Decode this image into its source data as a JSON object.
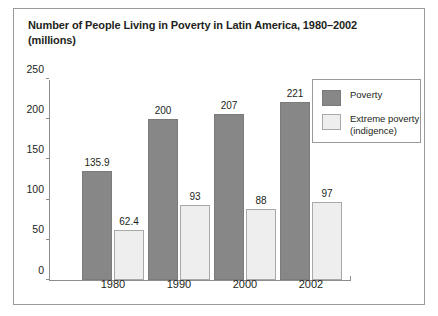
{
  "chart_data": {
    "type": "bar",
    "title": "Number of People Living in Poverty in Latin America, 1980–2002 (millions)",
    "xlabel": "",
    "ylabel": "",
    "ylim": [
      0,
      250
    ],
    "yticks": [
      "0",
      "50",
      "100",
      "150",
      "200",
      "250"
    ],
    "grid": false,
    "legend_position": "top-right",
    "categories": [
      "1980",
      "1990",
      "2000",
      "2002"
    ],
    "series": [
      {
        "name": "Poverty",
        "color": "#878787",
        "values": [
          135.9,
          200,
          207,
          221
        ],
        "labels": [
          "135.9",
          "200",
          "207",
          "221"
        ]
      },
      {
        "name": "Extreme poverty (indigence)",
        "color": "#eeeeee",
        "values": [
          62.4,
          93,
          88,
          97
        ],
        "labels": [
          "62.4",
          "93",
          "88",
          "97"
        ]
      }
    ]
  },
  "figure": {
    "title_line1": "Number of People Living in Poverty in Latin America, 1980–2002",
    "title_line2": "(millions)",
    "border_color": "#9a9a9a",
    "axis_color": "#8d8d8d"
  },
  "legend": {
    "items": [
      {
        "label": "Poverty",
        "color": "#878787"
      },
      {
        "label": "Extreme poverty\n(indigence)",
        "color": "#eeeeee"
      }
    ]
  }
}
